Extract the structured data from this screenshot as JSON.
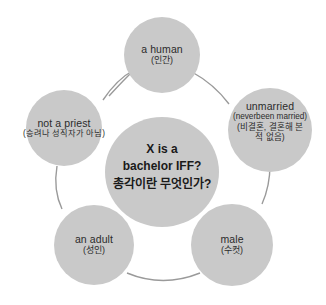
{
  "figure": {
    "type": "concept-wheel-diagram",
    "background_color": "#ffffff",
    "node_fill_color": "#c9c9c9",
    "connector_color": "#9a9a9a",
    "text_color": "#2b2b2b",
    "center_text_color": "#1a1a1a"
  },
  "center": {
    "name": "center-node",
    "line1": "X is a",
    "line2": "bachelor IFF?",
    "line3": "총각이란 무엇인가?"
  },
  "nodes": [
    {
      "id": "a-human",
      "english": "a human",
      "korean": "(인간)",
      "position": "top"
    },
    {
      "id": "unmarried",
      "english": "unmarried",
      "english_sub": "(neverbeen married)",
      "korean_line1": "(비결혼, 결혼해 본",
      "korean_line2": "적 없음)",
      "position": "right"
    },
    {
      "id": "male",
      "english": "male",
      "korean": "(수컷)",
      "position": "bottom-right"
    },
    {
      "id": "an-adult",
      "english": "an adult",
      "korean": "(성인)",
      "position": "bottom-left"
    },
    {
      "id": "not-a-priest",
      "english": "not a priest",
      "korean": "(승려나 성직자가 아님)",
      "position": "left"
    }
  ]
}
